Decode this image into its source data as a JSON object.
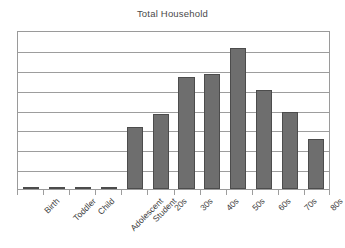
{
  "chart_data": {
    "type": "bar",
    "title": "Total Household",
    "subtitle": "",
    "xlabel": "",
    "ylabel": "",
    "categories": [
      "Birth",
      "Toddler",
      "Child",
      "Adolescent",
      "Student",
      "20s",
      "30s",
      "40s",
      "50s",
      "60s",
      "70s",
      "80s"
    ],
    "values": [
      0.1,
      0.1,
      0.1,
      0.1,
      3.1,
      3.75,
      5.65,
      5.8,
      7.1,
      5.0,
      3.85,
      2.5
    ],
    "ylim": [
      0,
      8
    ],
    "y_tick_labels": [],
    "gridlines": 8,
    "grid": true,
    "legend": "none",
    "bar_color": "#6e6e6e",
    "bar_border_color": "#4c4c4c",
    "plot_border_color": "#9a9a9a",
    "gridline_color": "#9d9d9d",
    "title_color": "#4a4a4a",
    "label_color": "#3d3d3d",
    "background": "#ffffff"
  }
}
